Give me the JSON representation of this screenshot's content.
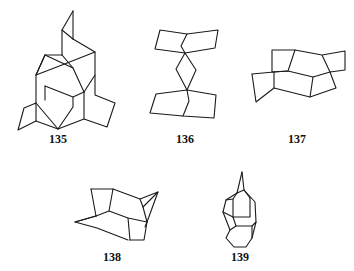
{
  "figure": {
    "compounds": [
      {
        "id": "135",
        "label": "135",
        "label_pos": [
          58,
          133
        ]
      },
      {
        "id": "136",
        "label": "136",
        "label_pos": [
          185,
          133
        ]
      },
      {
        "id": "137",
        "label": "137",
        "label_pos": [
          297,
          133
        ]
      },
      {
        "id": "138",
        "label": "138",
        "label_pos": [
          112,
          251
        ]
      },
      {
        "id": "139",
        "label": "139",
        "label_pos": [
          240,
          251
        ]
      }
    ]
  },
  "colors": {
    "ink": "#1a1a1a",
    "background": "#ffffff"
  }
}
